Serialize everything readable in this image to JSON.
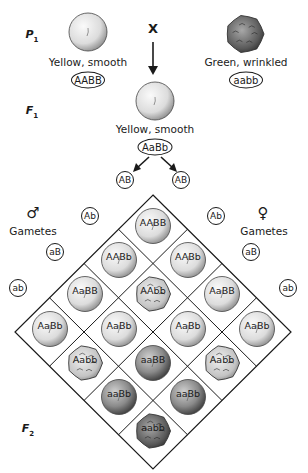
{
  "parents": {
    "generation_label": "P",
    "generation_sub": "1",
    "cross_symbol": "X",
    "left": {
      "phenotype": "Yellow, smooth",
      "genotype": "AABB",
      "seed": "yellow-smooth"
    },
    "right": {
      "phenotype": "Green, wrinkled",
      "genotype": "aabb",
      "seed": "green-wrinkled"
    }
  },
  "f1": {
    "generation_label": "F",
    "generation_sub": "1",
    "phenotype": "Yellow, smooth",
    "genotype": "AaBb",
    "seed": "yellow-smooth"
  },
  "gametes": {
    "male_symbol": "♂",
    "female_symbol": "♀",
    "male_label": "Gametes",
    "female_label": "Gametes",
    "male": [
      "AB",
      "Ab",
      "aB",
      "ab"
    ],
    "female": [
      "AB",
      "Ab",
      "aB",
      "ab"
    ]
  },
  "f2": {
    "generation_label": "F",
    "generation_sub": "2",
    "cells": [
      {
        "genotype": "AABB",
        "seed": "yellow-smooth"
      },
      {
        "genotype": "AABb",
        "seed": "yellow-smooth"
      },
      {
        "genotype": "AABb",
        "seed": "yellow-smooth"
      },
      {
        "genotype": "AaBB",
        "seed": "yellow-smooth"
      },
      {
        "genotype": "AAbb",
        "seed": "yellow-wrinkled"
      },
      {
        "genotype": "AaBB",
        "seed": "yellow-smooth"
      },
      {
        "genotype": "AaBb",
        "seed": "yellow-smooth"
      },
      {
        "genotype": "AaBb",
        "seed": "yellow-smooth"
      },
      {
        "genotype": "AaBb",
        "seed": "yellow-smooth"
      },
      {
        "genotype": "AaBb",
        "seed": "yellow-smooth"
      },
      {
        "genotype": "Aabb",
        "seed": "yellow-wrinkled"
      },
      {
        "genotype": "aaBB",
        "seed": "green-smooth"
      },
      {
        "genotype": "Aabb",
        "seed": "yellow-wrinkled"
      },
      {
        "genotype": "aaBb",
        "seed": "green-smooth"
      },
      {
        "genotype": "aaBb",
        "seed": "green-smooth"
      },
      {
        "genotype": "aabb",
        "seed": "green-wrinkled"
      }
    ]
  },
  "colors": {
    "line": "#1a1a1a",
    "yellow_seed_light": "#f4f4f4",
    "yellow_seed_dark": "#9a9a9a",
    "green_seed_light": "#b8b8b8",
    "green_seed_dark": "#3a3a3a"
  }
}
